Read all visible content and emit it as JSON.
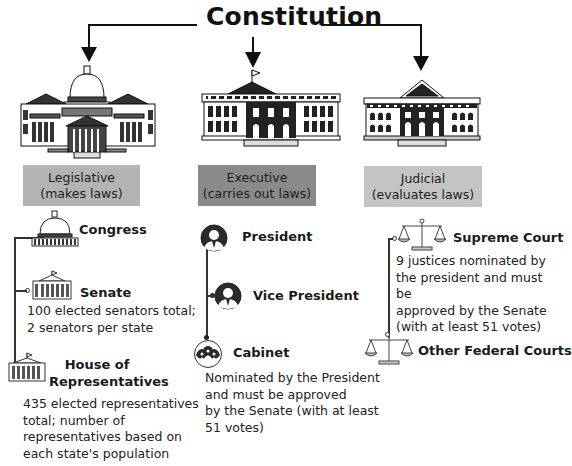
{
  "title": "Constitution",
  "colors": {
    "legislative_box": "#b4b4b4",
    "executive_box": "#8a8a8a",
    "judicial_box": "#c4c4c4",
    "lines": "#111111"
  },
  "branches": [
    {
      "name": "Legislative",
      "role": "(makes laws)",
      "building_icon": "capitol-building-icon",
      "items": [
        {
          "label": "Congress",
          "icon": "capitol-dome-icon"
        },
        {
          "label": "Senate",
          "icon": "senate-building-icon",
          "description": "100 elected senators total; 2 senators per state"
        },
        {
          "label_line1": "House of",
          "label_line2": "Representatives",
          "icon": "house-building-icon",
          "description": "435 elected representatives total; number of representatives based on each state's population"
        }
      ]
    },
    {
      "name": "Executive",
      "role": "(carries out laws)",
      "building_icon": "white-house-icon",
      "items": [
        {
          "label": "President",
          "icon": "person-icon"
        },
        {
          "label": "Vice President",
          "icon": "person-icon"
        },
        {
          "label": "Cabinet",
          "icon": "group-icon",
          "description": "Nominated by the President and must be approved by the Senate (with at least 51 votes)"
        }
      ]
    },
    {
      "name": "Judicial",
      "role": "(evaluates laws)",
      "building_icon": "supreme-court-building-icon",
      "items": [
        {
          "label": "Supreme Court",
          "icon": "scales-icon",
          "description": "9 justices nominated by the president and must be approved by the Senate (with at least 51 votes)"
        },
        {
          "label": "Other Federal Courts",
          "icon": "scales-icon"
        }
      ]
    }
  ],
  "desc_lines": {
    "senate": [
      "100 elected senators total;",
      "2 senators per state"
    ],
    "house": [
      "435 elected representatives",
      "total; number of",
      "representatives based on",
      "each state's population"
    ],
    "cabinet": [
      "Nominated by the President",
      "and must be approved",
      "by the Senate (with at least",
      "51 votes)"
    ],
    "supreme": [
      "9 justices nominated by",
      "the president and must be",
      "approved by the Senate",
      "(with at least 51 votes)"
    ]
  }
}
